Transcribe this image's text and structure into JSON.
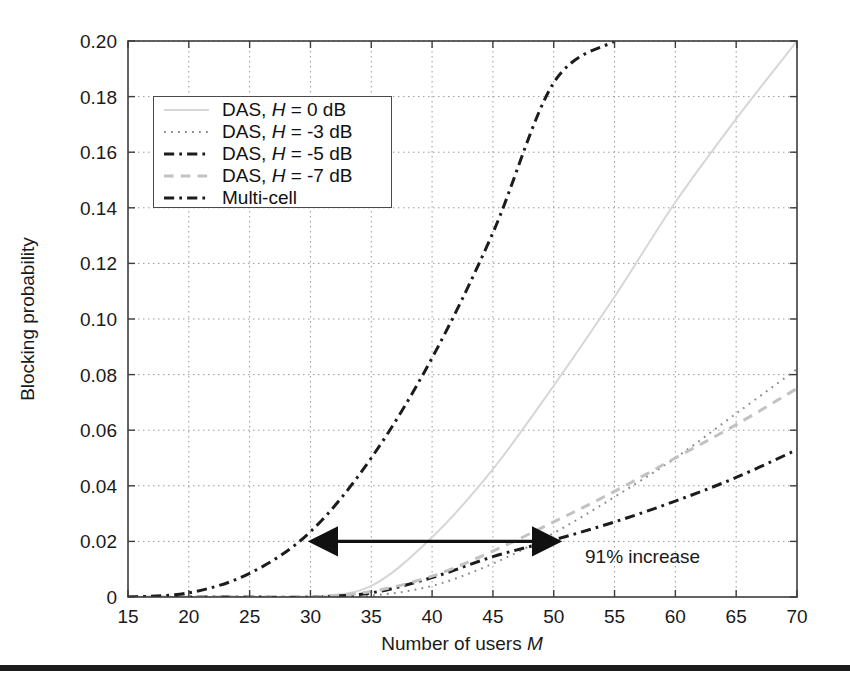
{
  "figure": {
    "background": "#ffffff",
    "bottom_rule_color": "#1b1b1b"
  },
  "axes": {
    "x_label_prefix": "Number of users ",
    "x_label_italic": "M",
    "y_label": "Blocking probability",
    "x_ticks": [
      "15",
      "20",
      "25",
      "30",
      "35",
      "40",
      "45",
      "50",
      "55",
      "60",
      "65",
      "70"
    ],
    "y_ticks": [
      "0",
      "0.02",
      "0.04",
      "0.06",
      "0.08",
      "0.10",
      "0.12",
      "0.14",
      "0.16",
      "0.18",
      "0.20"
    ],
    "axis_color": "#3d3d3d",
    "grid_color": "#9a9a9a"
  },
  "legend": {
    "items": [
      {
        "label_prefix": "DAS, ",
        "label_italic": "H",
        "label_suffix": " = 0 dB",
        "style": "solid",
        "color": "#d6d6d6",
        "width": 2.0
      },
      {
        "label_prefix": "DAS, ",
        "label_italic": "H",
        "label_suffix": " = -3 dB",
        "style": "dotted",
        "color": "#8a8a8a",
        "width": 2.0
      },
      {
        "label_prefix": "DAS, ",
        "label_italic": "H",
        "label_suffix": " = -5 dB",
        "style": "dashdot",
        "color": "#1c1c1c",
        "width": 3.0
      },
      {
        "label_prefix": "DAS, ",
        "label_italic": "H",
        "label_suffix": " = -7 dB",
        "style": "dashed",
        "color": "#c2c2c2",
        "width": 3.0
      },
      {
        "label_prefix": "Multi-cell",
        "label_italic": "",
        "label_suffix": "",
        "style": "dashdot",
        "color": "#1c1c1c",
        "width": 3.0
      }
    ]
  },
  "annotation": {
    "text": "91% increase",
    "arrow_color": "#111111",
    "arrow_x_start": 29.0,
    "arrow_x_end": 51.5,
    "arrow_y": 0.02
  },
  "chart_data": {
    "type": "line",
    "title": "",
    "xlabel": "Number of users M",
    "ylabel": "Blocking probability",
    "xlim": [
      15,
      70
    ],
    "ylim": [
      0,
      0.2
    ],
    "xticks": [
      15,
      20,
      25,
      30,
      35,
      40,
      45,
      50,
      55,
      60,
      65,
      70
    ],
    "yticks": [
      0,
      0.02,
      0.04,
      0.06,
      0.08,
      0.1,
      0.12,
      0.14,
      0.16,
      0.18,
      0.2
    ],
    "grid": true,
    "legend_position": "upper-left",
    "x": [
      15,
      20,
      25,
      30,
      35,
      40,
      45,
      50,
      55,
      60,
      65,
      70
    ],
    "series": [
      {
        "name": "DAS, H = 0 dB",
        "style": "solid",
        "color": "#d6d6d6",
        "values": [
          0,
          0,
          0,
          0,
          0.004,
          0.0215,
          0.046,
          0.076,
          0.108,
          0.142,
          0.172,
          0.2
        ]
      },
      {
        "name": "DAS, H = -3 dB",
        "style": "dotted",
        "color": "#8a8a8a",
        "values": [
          0,
          0,
          0,
          0,
          0.0005,
          0.004,
          0.012,
          0.023,
          0.036,
          0.05,
          0.066,
          0.082
        ]
      },
      {
        "name": "DAS, H = -5 dB",
        "style": "dashdot",
        "color": "#1c1c1c",
        "values": [
          0,
          0,
          0,
          0,
          0.0015,
          0.007,
          0.0145,
          0.0205,
          0.027,
          0.0345,
          0.043,
          0.053
        ]
      },
      {
        "name": "DAS, H = -7 dB",
        "style": "dashed",
        "color": "#c2c2c2",
        "values": [
          0,
          0,
          0,
          0,
          0.002,
          0.0075,
          0.0165,
          0.027,
          0.038,
          0.05,
          0.062,
          0.075
        ]
      },
      {
        "name": "Multi-cell",
        "style": "dashdot",
        "color": "#1c1c1c",
        "values": [
          0,
          0.0015,
          0.0085,
          0.0235,
          0.05,
          0.086,
          0.131,
          0.185,
          0.2,
          null,
          null,
          null
        ]
      }
    ],
    "annotations": [
      {
        "text": "91% increase",
        "type": "double-arrow",
        "x_from": 29.0,
        "x_to": 51.5,
        "y": 0.02
      }
    ]
  }
}
